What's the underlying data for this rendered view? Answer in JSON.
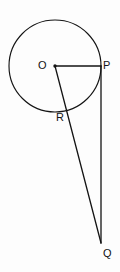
{
  "figure": {
    "type": "geometry-diagram",
    "width": 120,
    "height": 272,
    "background_color": "#fdfdfd",
    "stroke_color": "#141414"
  },
  "labels": {
    "center": "O",
    "tangent_point": "P",
    "secant_point": "R",
    "external_point": "Q"
  },
  "geometry": {
    "circle": {
      "center_x": 55,
      "center_y": 66,
      "radius": 46
    },
    "points": {
      "O": {
        "x": 55,
        "y": 66
      },
      "P": {
        "x": 101,
        "y": 66
      },
      "R": {
        "x": 69,
        "y": 112
      },
      "Q": {
        "x": 101,
        "y": 243
      }
    },
    "segments": [
      {
        "name": "OP",
        "from": "O",
        "to": "P"
      },
      {
        "name": "OQ",
        "from": "O",
        "to": "Q"
      },
      {
        "name": "PQ",
        "from": "P",
        "to": "Q"
      }
    ]
  }
}
